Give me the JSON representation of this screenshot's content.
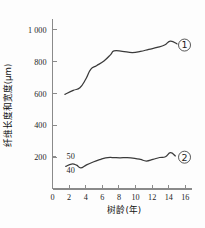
{
  "chart_data": {
    "type": "line",
    "title": "",
    "xlabel": "树龄(年)",
    "ylabel": "纤维长度和宽度(μm)",
    "xlim": [
      0,
      16.8
    ],
    "ylim": [
      0,
      1050
    ],
    "grid": false,
    "legend_position": "right-inline",
    "x_ticks": [
      "0",
      "2",
      "4",
      "6",
      "8",
      "10",
      "12",
      "14",
      "16"
    ],
    "x_tick_values": [
      0,
      2,
      4,
      6,
      8,
      10,
      12,
      14,
      16
    ],
    "y_ticks": [
      "200",
      "400",
      "600",
      "800",
      "1 000"
    ],
    "y_tick_values": [
      200,
      400,
      600,
      800,
      1000
    ],
    "secondary_annotations": [
      {
        "text": "50",
        "x": 1.7,
        "y": 205
      },
      {
        "text": "40",
        "x": 1.7,
        "y": 120
      }
    ],
    "series": [
      {
        "name": "①",
        "label": "①",
        "marker_label_x": 15.9,
        "marker_label_y": 905,
        "x": [
          1.5,
          2.5,
          3.3,
          4.0,
          4.6,
          5.3,
          6.2,
          7.0,
          7.4,
          8.4,
          9.6,
          10.6,
          11.6,
          12.6,
          13.5,
          14.2,
          15.0
        ],
        "values": [
          595,
          620,
          637,
          690,
          752,
          775,
          805,
          845,
          868,
          866,
          858,
          865,
          878,
          890,
          905,
          930,
          912
        ]
      },
      {
        "name": "②",
        "label": "②",
        "marker_label_x": 15.9,
        "marker_label_y": 200,
        "x": [
          1.6,
          2.3,
          2.9,
          3.4,
          4.1,
          4.9,
          5.7,
          6.4,
          7.2,
          8.1,
          9.0,
          9.9,
          10.6,
          11.3,
          12.1,
          12.9,
          13.6,
          14.2,
          14.8
        ],
        "values": [
          142,
          157,
          150,
          133,
          152,
          170,
          185,
          196,
          198,
          196,
          197,
          193,
          186,
          176,
          186,
          198,
          203,
          228,
          208
        ]
      }
    ]
  },
  "axis": {
    "y_axis_title": "纤维长度和宽度(μm)",
    "x_axis_title": "树龄(年)"
  }
}
